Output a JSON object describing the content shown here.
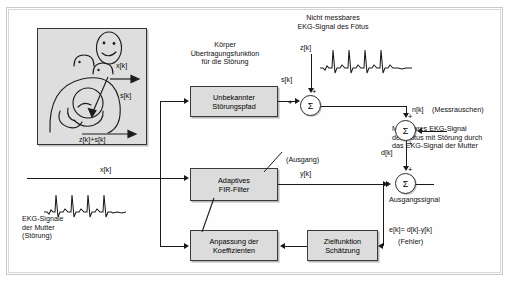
{
  "diagram": {
    "blocks": {
      "unknown_path": "Unbekannter\nStörungspfad",
      "adaptive_filter": "Adaptives\nFIR-Filter",
      "coeff_adapt": "Anpassung der\nKoeffizienten",
      "objective": "Zielfunktion\nSchätzung"
    },
    "annotations": {
      "body_transfer": "Körper\nÜbertragungsfunktion\nfür die Störung",
      "fetus_not_measurable": "Nicht messbares\nEKG-Signal des Fötus",
      "measurement_noise": "(Messrauschen)",
      "measurable_ekg": "Messbares EKG-Signal\ndes Fötus mit Störung durch\ndas EKG-Signal der Mutter",
      "mother_ekg": "EKG-Signale\nder Mutter\n(Störung)",
      "output_label": "(Ausgang)",
      "output_signal": "Ausgangssignal",
      "error_equation": "e[k]= d[k]-y[k]",
      "error_word": "(Fehler)"
    },
    "signals": {
      "x_illus": "x[k]",
      "s_illus": "s[k]",
      "zs_illus": "z[k]+s[k]",
      "z": "z[k]",
      "s": "s[k]",
      "n": "n[k]",
      "d": "d[k]",
      "x": "x[k]",
      "y": "y[k]"
    },
    "operators": {
      "sum_glyph": "Σ",
      "plus": "+",
      "minus": "-"
    },
    "colors": {
      "block_fill": "#dcdcdc",
      "block_stroke": "#3a3a3a",
      "line": "#1a1a1a",
      "panel_fill": "#dedede",
      "page_bg": "#ffffff"
    }
  }
}
